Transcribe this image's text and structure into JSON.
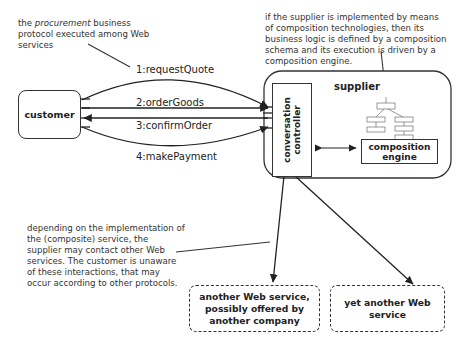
{
  "notes": {
    "procurement": {
      "prefix": "the ",
      "emphasis": "procurement",
      "line1_rest": " business",
      "line2": "protocol executed among Web",
      "line3": "services"
    },
    "composition": [
      "if the supplier is implemented by means",
      "of composition technologies, then its",
      "business logic is defined by a composition",
      "schema and its execution is driven by a",
      "composition engine."
    ],
    "other_services": [
      "depending on the implementation of",
      "the (composite) service, the",
      "supplier may contact other Web",
      "services. The customer is unaware",
      "of these interactions, that may",
      "occur according to other protocols."
    ]
  },
  "messages": [
    {
      "label": "1:requestQuote",
      "direction": "customer-to-supplier"
    },
    {
      "label": "2:orderGoods",
      "direction": "customer-to-supplier"
    },
    {
      "label": "3:confirmOrder",
      "direction": "supplier-to-customer"
    },
    {
      "label": "4:makePayment",
      "direction": "customer-to-supplier"
    }
  ],
  "nodes": {
    "customer": "customer",
    "supplier": "supplier",
    "conversation_controller": "conversation controller",
    "composition_engine_line1": "composition",
    "composition_engine_line2": "engine",
    "another_service": [
      "another Web service,",
      "possibly offered by",
      "another company"
    ],
    "yet_another_service": [
      "yet another Web",
      "service"
    ]
  }
}
